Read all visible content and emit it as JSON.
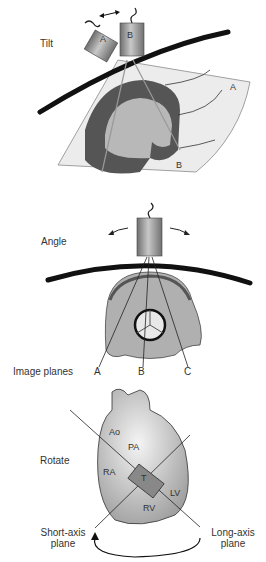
{
  "panels": {
    "tilt": {
      "label": "Tilt",
      "probe_a": "A",
      "probe_b": "B",
      "plane_a": "A",
      "plane_b": "B"
    },
    "angle": {
      "label": "Angle",
      "image_planes_label": "Image planes",
      "plane_a": "A",
      "plane_b": "B",
      "plane_c": "C"
    },
    "rotate": {
      "label": "Rotate",
      "structures": {
        "ao": "Ao",
        "pa": "PA",
        "ra": "RA",
        "rv": "RV",
        "lv": "LV",
        "t": "T"
      },
      "short_axis_line1": "Short-axis",
      "short_axis_line2": "plane",
      "long_axis_line1": "Long-axis",
      "long_axis_line2": "plane"
    }
  },
  "colors": {
    "probe": "#8a8a8a",
    "chest_wall": "#111111",
    "myocardium": "#555555",
    "chamber": "#b8b8b8",
    "sector": "#ececec"
  }
}
